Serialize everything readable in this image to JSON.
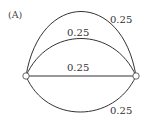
{
  "figure": {
    "panel_label": "(A)",
    "nodes": [
      {
        "id": "left",
        "x": 26,
        "y": 76
      },
      {
        "id": "right",
        "x": 136,
        "y": 76
      }
    ],
    "edges": [
      {
        "id": "outer-top-arc",
        "label": "0.25"
      },
      {
        "id": "inner-top-arc",
        "label": "0.25"
      },
      {
        "id": "straight-middle",
        "label": "0.25"
      },
      {
        "id": "bottom-arc",
        "label": "0.25"
      }
    ],
    "colors": {
      "edge": "#333333",
      "node_fill": "#ffffff",
      "node_stroke": "#555555",
      "text": "#333333"
    }
  }
}
